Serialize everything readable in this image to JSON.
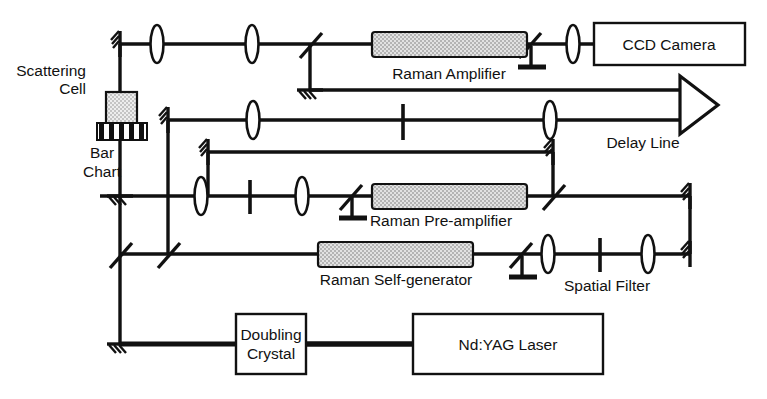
{
  "figure": {
    "type": "optical-beam-path-diagram",
    "width": 767,
    "height": 399,
    "background_color": "#ffffff",
    "line_color": "#111111",
    "rod_fill_color": "#c9c9c9",
    "box_fill_color": "#ffffff"
  },
  "labels": {
    "scattering_cell_line1": "Scattering",
    "scattering_cell_line2": "Cell",
    "bar_chart_line1": "Bar",
    "bar_chart_line2": "Chart",
    "raman_amplifier": "Raman Amplifier",
    "ccd_camera": "CCD Camera",
    "delay_line": "Delay Line",
    "raman_preamplifier": "Raman Pre-amplifier",
    "raman_self_generator": "Raman Self-generator",
    "spatial_filter": "Spatial Filter",
    "doubling_crystal_line1": "Doubling",
    "doubling_crystal_line2": "Crystal",
    "nd_yag_laser": "Nd:YAG Laser"
  },
  "components": {
    "boxes": [
      {
        "name": "ccd-camera-box",
        "label": "CCD Camera"
      },
      {
        "name": "doubling-crystal-box",
        "label": "Doubling Crystal"
      },
      {
        "name": "ndyag-laser-box",
        "label": "Nd:YAG Laser"
      }
    ],
    "gain_rods": [
      {
        "name": "raman-amplifier-rod",
        "label": "Raman Amplifier"
      },
      {
        "name": "raman-preamplifier-rod",
        "label": "Raman Pre-amplifier"
      },
      {
        "name": "raman-self-generator-rod",
        "label": "Raman Self-generator"
      }
    ],
    "optics": [
      {
        "name": "lens",
        "count": 9
      },
      {
        "name": "mirror",
        "count": 9
      },
      {
        "name": "beam-splitter",
        "count": 7
      },
      {
        "name": "aperture-slit",
        "count": 3
      },
      {
        "name": "scattering-cell",
        "count": 1
      },
      {
        "name": "bar-chart-target",
        "count": 1
      },
      {
        "name": "delay-line-arrow",
        "count": 1
      }
    ]
  }
}
